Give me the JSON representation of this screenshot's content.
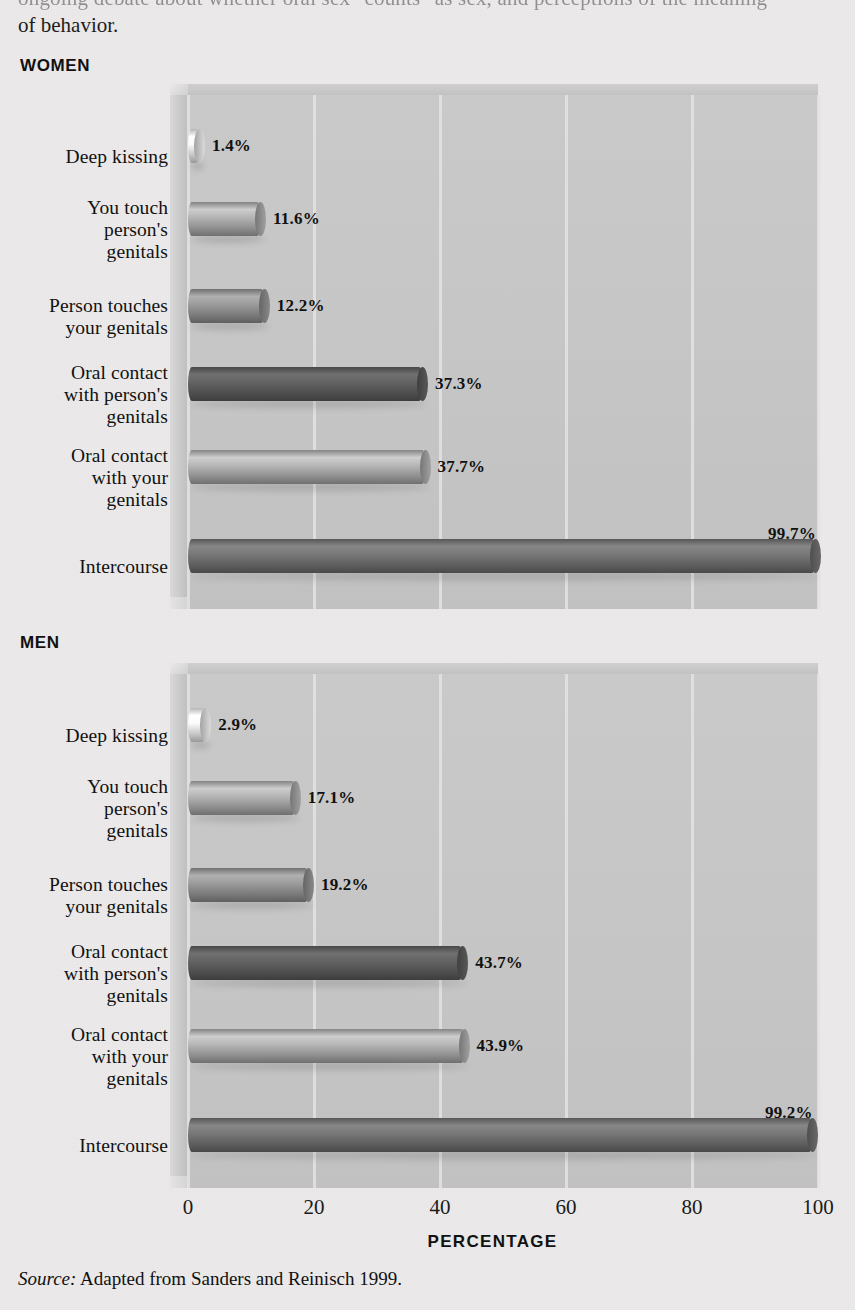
{
  "intro": {
    "line1_partial": "ongoing debate about whether oral sex \"counts\" as sex, and perceptions of the meaning",
    "line2": "of behavior."
  },
  "sections": {
    "women_title": "WOMEN",
    "men_title": "MEN"
  },
  "axis": {
    "ticks": [
      "0",
      "20",
      "40",
      "60",
      "80",
      "100"
    ],
    "title": "PERCENTAGE"
  },
  "source": {
    "prefix": "Source:",
    "text": "Adapted from Sanders and Reinisch 1999."
  },
  "colors": {
    "page_background": "#eceaea",
    "plot_background": "#c5c5c5",
    "gridline": "#e3e3e3",
    "bar_lightest": "#e6e6e6",
    "bar_light": "#b8b8b8",
    "bar_medium": "#a0a0a0",
    "bar_dark": "#5e5e5e",
    "bar_mid_light": "#9a9a9a",
    "bar_mid_dark": "#6e6e6e",
    "text": "#111111"
  },
  "chart_data": [
    {
      "type": "bar",
      "orientation": "horizontal",
      "title": "WOMEN",
      "xlabel": "PERCENTAGE",
      "ylabel": "",
      "xlim": [
        0,
        100
      ],
      "xticks": [
        0,
        20,
        40,
        60,
        80,
        100
      ],
      "grid": true,
      "legend": "none",
      "categories": [
        "Deep kissing",
        "You touch person's genitals",
        "Person touches your genitals",
        "Oral contact with person's genitals",
        "Oral contact with your genitals",
        "Intercourse"
      ],
      "values": [
        1.4,
        11.6,
        12.2,
        37.3,
        37.7,
        99.7
      ],
      "data_labels": [
        "1.4%",
        "11.6%",
        "12.2%",
        "37.3%",
        "37.7%",
        "99.7%"
      ],
      "bar_colors": [
        "#e8e8e8",
        "#a8a8a8",
        "#909090",
        "#5c5c5c",
        "#a9a9a9",
        "#6f6f6f"
      ]
    },
    {
      "type": "bar",
      "orientation": "horizontal",
      "title": "MEN",
      "xlabel": "PERCENTAGE",
      "ylabel": "",
      "xlim": [
        0,
        100
      ],
      "xticks": [
        0,
        20,
        40,
        60,
        80,
        100
      ],
      "grid": true,
      "legend": "none",
      "categories": [
        "Deep kissing",
        "You touch person's genitals",
        "Person touches your genitals",
        "Oral contact with person's genitals",
        "Oral contact with your genitals",
        "Intercourse"
      ],
      "values": [
        2.9,
        17.1,
        19.2,
        43.7,
        43.9,
        99.2
      ],
      "data_labels": [
        "2.9%",
        "17.1%",
        "19.2%",
        "43.7%",
        "43.9%",
        "99.2%"
      ],
      "bar_colors": [
        "#e8e8e8",
        "#a8a8a8",
        "#909090",
        "#5c5c5c",
        "#a9a9a9",
        "#6f6f6f"
      ]
    }
  ],
  "category_label_lines": [
    [
      "Deep kissing"
    ],
    [
      "You touch",
      "person's",
      "genitals"
    ],
    [
      "Person touches",
      "your genitals"
    ],
    [
      "Oral contact",
      "with person's",
      "genitals"
    ],
    [
      "Oral contact",
      "with your",
      "genitals"
    ],
    [
      "Intercourse"
    ]
  ]
}
